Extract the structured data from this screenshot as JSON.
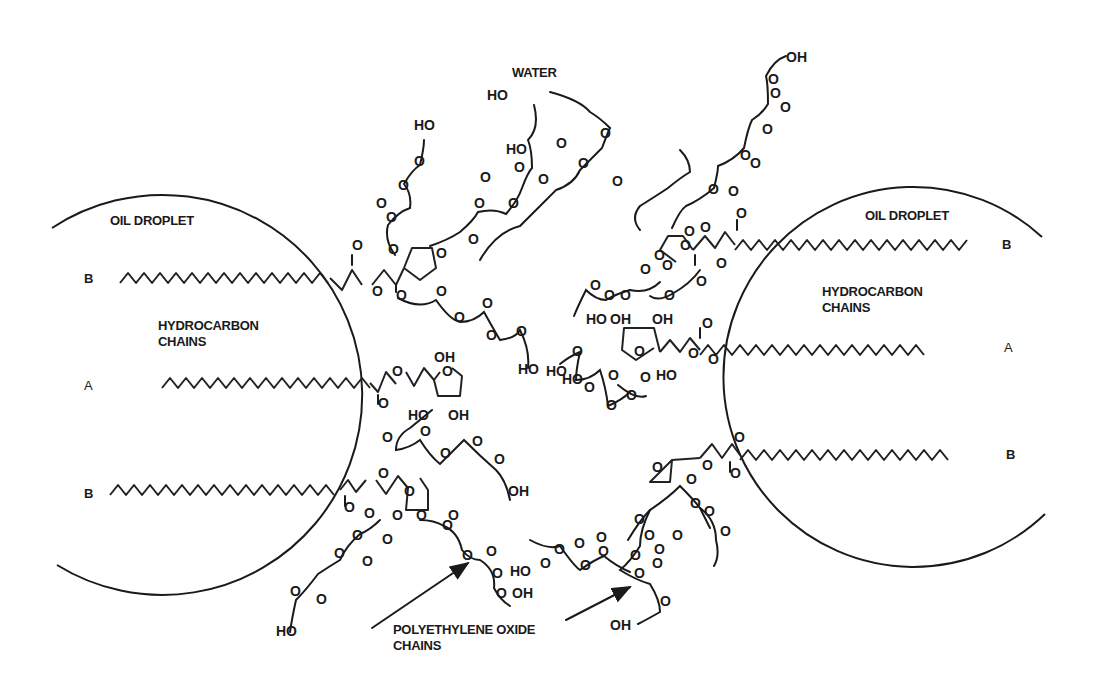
{
  "labels": {
    "water": "WATER",
    "oil_droplet_left": "OIL DROPLET",
    "oil_droplet_right": "OIL DROPLET",
    "hydrocarbon_left_1": "HYDROCARBON",
    "hydrocarbon_left_2": "CHAINS",
    "hydrocarbon_right_1": "HYDROCARBON",
    "hydrocarbon_right_2": "CHAINS",
    "peo_1": "POLYETHYLENE OXIDE",
    "peo_2": "CHAINS",
    "chain_left_top": "B",
    "chain_left_mid": "A",
    "chain_left_bottom": "B",
    "chain_right_top": "B",
    "chain_right_mid": "A",
    "chain_right_bottom": "B"
  },
  "atoms": {
    "O": "O",
    "OH": "OH",
    "HO": "HO"
  },
  "droplets": [
    {
      "name": "left-oil-droplet",
      "cx": 160,
      "cy": 395,
      "r": 200
    },
    {
      "name": "right-oil-droplet",
      "cx": 915,
      "cy": 390,
      "r": 190
    }
  ],
  "hydrocarbon_chains": [
    {
      "name": "left-chain-B-top",
      "x_start": 120,
      "x_end": 330,
      "y": 278,
      "label": "B"
    },
    {
      "name": "left-chain-A",
      "x_start": 162,
      "x_end": 370,
      "y": 383,
      "label": "A"
    },
    {
      "name": "left-chain-B-bottom",
      "x_start": 110,
      "x_end": 340,
      "y": 490,
      "label": "B"
    },
    {
      "name": "right-chain-B-top",
      "x_start": 735,
      "x_end": 968,
      "y": 245,
      "label": "B"
    },
    {
      "name": "right-chain-A",
      "x_start": 700,
      "x_end": 930,
      "y": 350,
      "label": "A"
    },
    {
      "name": "right-chain-B-bottom",
      "x_start": 740,
      "x_end": 955,
      "y": 455,
      "label": "B"
    }
  ],
  "colors": {
    "ink": "#1a1a1a",
    "background": "#ffffff"
  }
}
